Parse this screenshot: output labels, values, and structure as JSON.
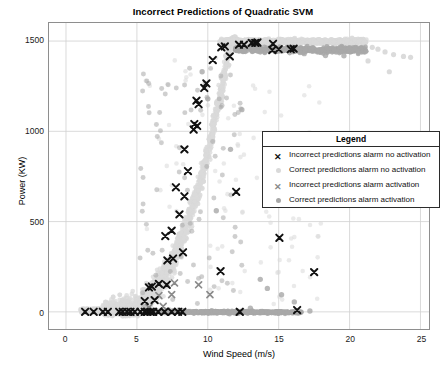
{
  "chart_data": {
    "type": "scatter",
    "title": "Incorrect Predictions of Quadratic SVM",
    "xlabel": "Wind Speed (m/s)",
    "ylabel": "Power (KW)",
    "xlim": [
      -1.2,
      25.6
    ],
    "ylim": [
      -95,
      1600
    ],
    "xticks": [
      0,
      5,
      10,
      15,
      20,
      25
    ],
    "yticks": [
      0,
      500,
      1000,
      1500
    ],
    "grid": true,
    "legend_title": "Legend",
    "legend_position": "center-right",
    "series": [
      {
        "name": "Incorrect predictions alarm no activation",
        "marker": "x",
        "color": "#111111",
        "size": 5.4,
        "points": [
          [
            1.35,
            0
          ],
          [
            1.95,
            0
          ],
          [
            2.6,
            0
          ],
          [
            2.95,
            0
          ],
          [
            3.75,
            0
          ],
          [
            4.0,
            0
          ],
          [
            4.3,
            0
          ],
          [
            4.55,
            0
          ],
          [
            4.85,
            0
          ],
          [
            5.25,
            0
          ],
          [
            5.55,
            0
          ],
          [
            5.75,
            0
          ],
          [
            5.95,
            0
          ],
          [
            6.15,
            0
          ],
          [
            6.5,
            0
          ],
          [
            6.95,
            0
          ],
          [
            7.45,
            0
          ],
          [
            7.9,
            0
          ],
          [
            8.2,
            0
          ],
          [
            5.55,
            60
          ],
          [
            6.25,
            65
          ],
          [
            6.55,
            155
          ],
          [
            7.1,
            150
          ],
          [
            5.85,
            135
          ],
          [
            6.05,
            140
          ],
          [
            7.15,
            285
          ],
          [
            7.55,
            295
          ],
          [
            8.25,
            330
          ],
          [
            7.0,
            420
          ],
          [
            7.45,
            450
          ],
          [
            8.0,
            540
          ],
          [
            8.35,
            640
          ],
          [
            7.75,
            690
          ],
          [
            8.6,
            780
          ],
          [
            8.35,
            900
          ],
          [
            9.0,
            1010
          ],
          [
            9.05,
            1040
          ],
          [
            9.25,
            1030
          ],
          [
            9.2,
            1170
          ],
          [
            9.35,
            1150
          ],
          [
            9.9,
            1265
          ],
          [
            9.75,
            1240
          ],
          [
            10.35,
            1395
          ],
          [
            10.95,
            1465
          ],
          [
            11.2,
            1470
          ],
          [
            11.55,
            1415
          ],
          [
            12.2,
            1480
          ],
          [
            12.55,
            1480
          ],
          [
            13.1,
            1490
          ],
          [
            13.35,
            1490
          ],
          [
            13.5,
            1492
          ],
          [
            14.6,
            1485
          ],
          [
            14.55,
            1450
          ],
          [
            15.0,
            1455
          ],
          [
            15.85,
            1455
          ],
          [
            16.05,
            1458
          ],
          [
            12.0,
            665
          ],
          [
            10.9,
            225
          ],
          [
            15.05,
            660
          ],
          [
            15.05,
            410
          ],
          [
            16.3,
            10
          ],
          [
            17.5,
            220
          ],
          [
            12.25,
            0
          ]
        ]
      },
      {
        "name": "Correct predictions alarm no activation",
        "marker": "o",
        "color": "#d9d9d9",
        "size": 5.0,
        "description": "Large light-gray cloud forming the turbine power curve: flat near 0 below cut-in ~3.5 m/s, steep S-shaped rise from ~4 to ~11 m/s, then saturated plateau near 1500 KW out to ~21 m/s with a few stragglers to 24 m/s."
      },
      {
        "name": "Incorrect predictions alarm activation",
        "marker": "x",
        "color": "#8a8a8a",
        "size": 5.0,
        "points": [
          [
            6.55,
            90
          ],
          [
            7.45,
            95
          ],
          [
            7.65,
            160
          ],
          [
            9.35,
            150
          ],
          [
            10.15,
            95
          ],
          [
            5.85,
            25
          ],
          [
            6.85,
            30
          ],
          [
            13.25,
            1490
          ],
          [
            13.45,
            1488
          ],
          [
            12.3,
            0
          ]
        ]
      },
      {
        "name": "Correct predictions alarm activation",
        "marker": "o",
        "color": "#a8a8a8",
        "size": 5.0,
        "description": "Medium-gray band: a horizontal run along 0 KW from ~8 to ~16.5 m/s and a second horizontal run near 1450 KW from ~12 to ~21 m/s, plus scattered medium-gray dots within the rise region."
      }
    ]
  },
  "legend": {
    "title": "Legend",
    "rows": [
      {
        "marker": "x-dark",
        "label": "Incorrect predictions alarm no activation"
      },
      {
        "marker": "dot-light",
        "label": "Correct predictions alarm no activation"
      },
      {
        "marker": "x-gray",
        "label": "Incorrect predictions alarm activation"
      },
      {
        "marker": "dot-gray",
        "label": "Correct predictions alarm activation"
      }
    ]
  },
  "axes": {
    "x_tick_labels": [
      "0",
      "5",
      "10",
      "15",
      "20",
      "25"
    ],
    "y_tick_labels": [
      "0",
      "500",
      "1000",
      "1500"
    ]
  },
  "colors": {
    "incorrect_no_activation": "#111111",
    "correct_no_activation": "#d9d9d9",
    "incorrect_activation": "#8a8a8a",
    "correct_activation": "#a8a8a8",
    "grid": "#d0d0d0",
    "axis": "#8e8e8e",
    "background": "#ffffff"
  }
}
